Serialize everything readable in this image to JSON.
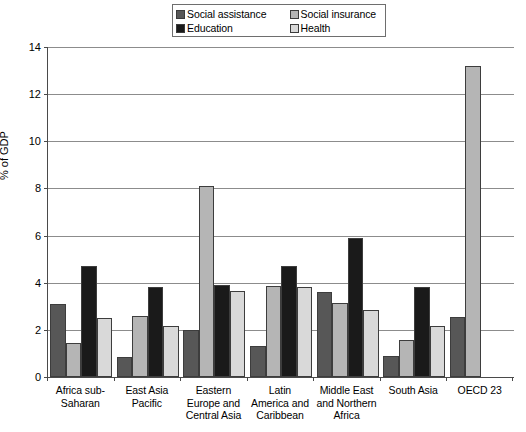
{
  "chart": {
    "type": "bar",
    "ylabel": "% of GDP"
  },
  "legend": {
    "items": [
      {
        "label": "Social assistance",
        "color": "#575757"
      },
      {
        "label": "Social insurance",
        "color": "#b5b5b5"
      },
      {
        "label": "Education",
        "color": "#1a1a1a"
      },
      {
        "label": "Health",
        "color": "#d9d9d9"
      }
    ]
  },
  "y_axis": {
    "ticks": [
      "0",
      "2",
      "4",
      "6",
      "8",
      "10",
      "12",
      "14"
    ]
  },
  "chart_data": {
    "type": "bar",
    "title": "",
    "xlabel": "",
    "ylabel": "% of GDP",
    "ylim": [
      0,
      14
    ],
    "yticks": [
      0,
      2,
      4,
      6,
      8,
      10,
      12,
      14
    ],
    "grid": true,
    "legend_position": "top-center",
    "categories": [
      "Africa sub-Saharan",
      "East Asia Pacific",
      "Eastern Europe and Central Asia",
      "Latin America and Caribbean",
      "Middle East and Northern Africa",
      "South Asia",
      "OECD 23"
    ],
    "category_lines": [
      [
        "Africa sub-",
        "Saharan"
      ],
      [
        "East Asia",
        "Pacific"
      ],
      [
        "Eastern",
        "Europe and",
        "Central Asia"
      ],
      [
        "Latin",
        "America and",
        "Caribbean"
      ],
      [
        "Middle East",
        "and Northern",
        "Africa"
      ],
      [
        "South Asia"
      ],
      [
        "OECD 23"
      ]
    ],
    "series": [
      {
        "name": "Social assistance",
        "color": "#575757",
        "values": [
          3.1,
          0.85,
          2.0,
          1.3,
          3.6,
          0.9,
          2.55
        ]
      },
      {
        "name": "Social insurance",
        "color": "#b5b5b5",
        "values": [
          1.45,
          2.6,
          8.1,
          3.85,
          3.15,
          1.55,
          13.2
        ]
      },
      {
        "name": "Education",
        "color": "#1a1a1a",
        "values": [
          4.7,
          3.8,
          3.9,
          4.7,
          5.9,
          3.8,
          null
        ]
      },
      {
        "name": "Health",
        "color": "#d9d9d9",
        "values": [
          2.5,
          2.15,
          3.65,
          3.8,
          2.85,
          2.15,
          null
        ]
      }
    ]
  }
}
